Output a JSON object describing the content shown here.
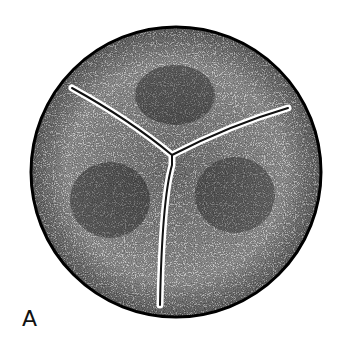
{
  "figure": {
    "panel_label": "A",
    "colors": {
      "ink": "#111111",
      "paper": "#ffffff"
    }
  }
}
